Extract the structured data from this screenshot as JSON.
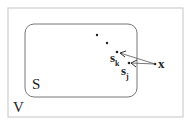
{
  "diagram": {
    "outer_set_label": "V",
    "inner_set_label": "S",
    "points": [
      {
        "name": "point-1",
        "x": 97,
        "y": 35
      },
      {
        "name": "point-2",
        "x": 107,
        "y": 43
      },
      {
        "name": "s_k",
        "label": "s",
        "subscript": "k",
        "x": 117,
        "y": 53
      },
      {
        "name": "s_j",
        "label": "s",
        "subscript": "j",
        "x": 129,
        "y": 63
      }
    ],
    "query_point": {
      "label": "x",
      "x": 155,
      "y": 64
    },
    "colors": {
      "stroke": "#777777",
      "text": "#222222",
      "outer_border": "#cccccc"
    }
  }
}
